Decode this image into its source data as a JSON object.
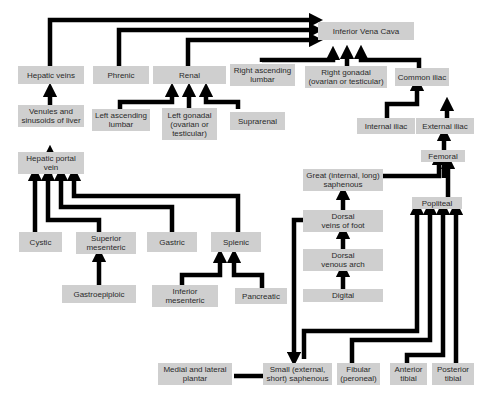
{
  "diagram": {
    "type": "venous-drainage-flowchart",
    "colors": {
      "box_fill": "#cfcfcf",
      "arrow": "#000000",
      "text": "#2a2a2a",
      "background": "#ffffff"
    },
    "nodes": {
      "ivc": "Inferior Vena Cava",
      "hepatic_veins": "Hepatic veins",
      "phrenic": "Phrenic",
      "renal": "Renal",
      "right_asc_lumbar": "Right ascending\nlumbar",
      "right_gonadal": "Right gonadal\n(ovarian or testicular)",
      "common_iliac": "Common iliac",
      "venules": "Venules and\nsinusoids of liver",
      "left_asc_lumbar": "Left ascending\nlumbar",
      "left_gonadal": "Left gonadal\n(ovarian or\ntesticular)",
      "suprarenal": "Suprarenal",
      "internal_iliac": "Internal iliac",
      "external_iliac": "External iliac",
      "hepatic_portal": "Hepatic portal\nvein",
      "femoral": "Femoral",
      "great_saphenous": "Great (internal, long)\nsaphenous",
      "popliteal": "Popliteal",
      "dorsal_veins_foot": "Dorsal\nveins of foot",
      "cystic": "Cystic",
      "superior_mesenteric": "Superior\nmesenteric",
      "gastric": "Gastric",
      "splenic": "Splenic",
      "dorsal_venous_arch": "Dorsal\nvenous arch",
      "digital": "Digital",
      "gastroepiploic": "Gastroepiploic",
      "inferior_mesenteric": "Inferior\nmesenteric",
      "pancreatic": "Pancreatic",
      "medial_lateral_plantar": "Medial and lateral\nplantar",
      "small_saphenous": "Small (external,\nshort) saphenous",
      "fibular": "Fibular\n(peroneal)",
      "anterior_tibial": "Anterior\ntibial",
      "posterior_tibial": "Posterior\ntibial"
    },
    "edges": [
      [
        "hepatic_veins",
        "ivc"
      ],
      [
        "phrenic",
        "ivc"
      ],
      [
        "renal",
        "ivc"
      ],
      [
        "right_asc_lumbar",
        "ivc"
      ],
      [
        "right_gonadal",
        "ivc"
      ],
      [
        "common_iliac",
        "ivc"
      ],
      [
        "venules",
        "hepatic_veins"
      ],
      [
        "hepatic_portal",
        "venules"
      ],
      [
        "left_asc_lumbar",
        "renal"
      ],
      [
        "left_gonadal",
        "renal"
      ],
      [
        "suprarenal",
        "renal"
      ],
      [
        "internal_iliac",
        "common_iliac"
      ],
      [
        "external_iliac",
        "common_iliac"
      ],
      [
        "femoral",
        "external_iliac"
      ],
      [
        "great_saphenous",
        "femoral"
      ],
      [
        "popliteal",
        "femoral"
      ],
      [
        "dorsal_veins_foot",
        "great_saphenous"
      ],
      [
        "dorsal_venous_arch",
        "dorsal_veins_foot"
      ],
      [
        "digital",
        "dorsal_venous_arch"
      ],
      [
        "dorsal_veins_foot",
        "small_saphenous"
      ],
      [
        "cystic",
        "hepatic_portal"
      ],
      [
        "superior_mesenteric",
        "hepatic_portal"
      ],
      [
        "gastric",
        "hepatic_portal"
      ],
      [
        "splenic",
        "hepatic_portal"
      ],
      [
        "gastroepiploic",
        "superior_mesenteric"
      ],
      [
        "inferior_mesenteric",
        "splenic"
      ],
      [
        "pancreatic",
        "splenic"
      ],
      [
        "medial_lateral_plantar",
        "small_saphenous"
      ],
      [
        "small_saphenous",
        "popliteal"
      ],
      [
        "fibular",
        "popliteal"
      ],
      [
        "anterior_tibial",
        "popliteal"
      ],
      [
        "posterior_tibial",
        "popliteal"
      ]
    ]
  }
}
